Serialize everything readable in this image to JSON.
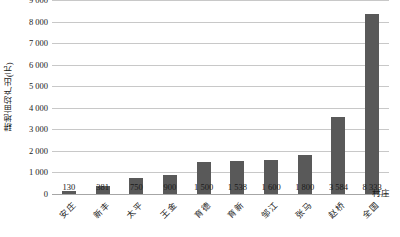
{
  "chart_data": {
    "type": "bar",
    "title": "",
    "xlabel": "村庄",
    "ylabel": "耕地亩均产出(元)",
    "categories": [
      "安庄",
      "新丰",
      "太平",
      "王金",
      "育德",
      "育新",
      "邹江",
      "张马",
      "赵桥",
      "全国"
    ],
    "values": [
      130,
      381,
      750,
      900,
      1500,
      1538,
      1600,
      1800,
      3584,
      8333
    ],
    "value_labels": [
      "130",
      "381",
      "750",
      "900",
      "1 500",
      "1 538",
      "1 600",
      "1 800",
      "3 584",
      "8 333"
    ],
    "ylim": [
      0,
      9000
    ],
    "y_ticks": [
      0,
      1000,
      2000,
      3000,
      4000,
      5000,
      6000,
      7000,
      8000,
      9000
    ],
    "y_tick_labels": [
      "0",
      "1 000",
      "2 000",
      "3 000",
      "4 000",
      "5 000",
      "6 000",
      "7 000",
      "8 000",
      "9 000"
    ],
    "grid": true,
    "legend": "none",
    "bar_color": "#595959",
    "gridline_color": "#c8c8c8",
    "axis_color": "#a6a6a6",
    "text_color": "#1a1a1a",
    "background": "#ffffff"
  }
}
